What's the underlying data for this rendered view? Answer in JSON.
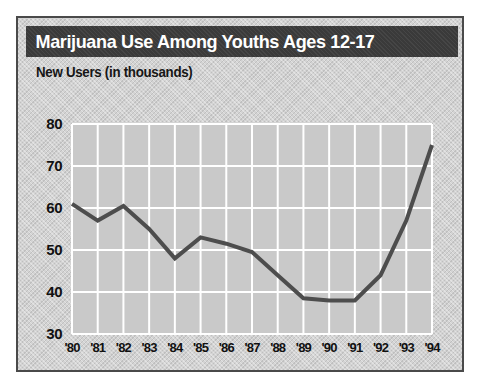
{
  "card": {
    "title": "Marijuana Use Among Youths Ages 12-17",
    "subtitle": "New Users (in thousands)",
    "title_bar_color": "#3a3a3a",
    "background_color": "#d3d3d3",
    "border_color": "#4a4a4a",
    "title_text_color": "#ffffff"
  },
  "chart_data": {
    "type": "line",
    "title": "Marijuana Use Among Youths Ages 12-17",
    "subtitle": "New Users (in thousands)",
    "xlabel": "",
    "ylabel": "New Users (in thousands)",
    "categories": [
      "'80",
      "'81",
      "'82",
      "'83",
      "'84",
      "'85",
      "'86",
      "'87",
      "'88",
      "'89",
      "'90",
      "'91",
      "'92",
      "'93",
      "'94"
    ],
    "values": [
      61,
      57,
      60.5,
      55,
      48,
      53,
      51.5,
      49.5,
      44,
      38.5,
      38,
      38,
      44,
      57,
      75
    ],
    "series": [
      {
        "name": "New Users (in thousands)",
        "values": [
          61,
          57,
          60.5,
          55,
          48,
          53,
          51.5,
          49.5,
          44,
          38.5,
          38,
          38,
          44,
          57,
          75
        ],
        "color": "#4d4d4d"
      }
    ],
    "ylim": [
      30,
      80
    ],
    "yticks": [
      30,
      40,
      50,
      60,
      70,
      80
    ],
    "ytick_labels": [
      "30",
      "40",
      "50",
      "60",
      "70",
      "80"
    ],
    "xlim": [
      "'80",
      "'94"
    ],
    "xticks": [
      "'80",
      "'81",
      "'82",
      "'83",
      "'84",
      "'85",
      "'86",
      "'87",
      "'88",
      "'89",
      "'90",
      "'91",
      "'92",
      "'93",
      "'94"
    ],
    "grid": true,
    "grid_color": "#ffffff",
    "legend": false,
    "legend_position": "none",
    "line_color": "#4d4d4d",
    "line_width": 4,
    "plot_background": "#c9c9c9"
  }
}
